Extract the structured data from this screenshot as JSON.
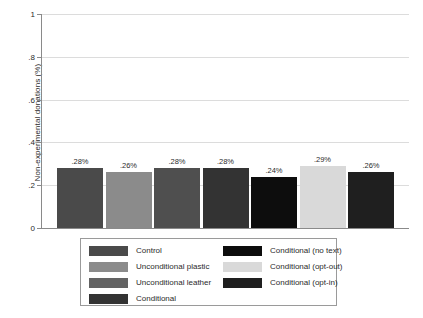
{
  "chart_data": {
    "type": "bar",
    "title": "",
    "xlabel": "",
    "ylabel": "Non-experimental donations (%)",
    "ylim": [
      0,
      1
    ],
    "grid": true,
    "legend_position": "bottom",
    "ytick_labels": [
      "0",
      ".2",
      ".4",
      ".6",
      ".8",
      "1"
    ],
    "ytick_values": [
      0,
      0.2,
      0.4,
      0.6,
      0.8,
      1
    ],
    "categories": [
      "Control",
      "Unconditional plastic",
      "Unconditional leather",
      "Conditional",
      "Conditional (no text)",
      "Conditional (opt-out)",
      "Conditional (opt-in)"
    ],
    "values": [
      0.28,
      0.26,
      0.28,
      0.28,
      0.24,
      0.29,
      0.26
    ],
    "data_labels": [
      ".28%",
      ".26%",
      ".28%",
      ".28%",
      ".24%",
      ".29%",
      ".26%"
    ],
    "colors": [
      "#4a4a4a",
      "#8b8b8b",
      "#4f4f4f",
      "#333333",
      "#0d0d0d",
      "#d9d9d9",
      "#1f1f1f"
    ]
  },
  "legend": {
    "left_column": [
      {
        "label": "Control",
        "color": "#4a4a4a"
      },
      {
        "label": "Unconditional plastic",
        "color": "#8b8b8b"
      },
      {
        "label": "Unconditional leather",
        "color": "#636363"
      },
      {
        "label": "Conditional",
        "color": "#333333"
      }
    ],
    "right_column": [
      {
        "label": "Conditional (no text)",
        "color": "#0d0d0d"
      },
      {
        "label": "Conditional (opt-out)",
        "color": "#d9d9d9"
      },
      {
        "label": "Conditional (opt-in)",
        "color": "#1f1f1f"
      }
    ]
  }
}
